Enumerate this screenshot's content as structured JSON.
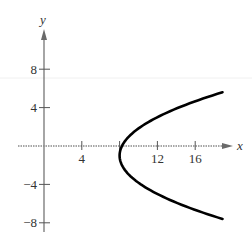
{
  "chart_data": {
    "type": "line",
    "title": "",
    "xlabel": "x",
    "ylabel": "y",
    "xlim": [
      0,
      19
    ],
    "ylim": [
      -9,
      11
    ],
    "x_ticks": [
      4,
      8,
      12,
      16
    ],
    "x_tick_labels": [
      "4",
      "",
      "12",
      "16"
    ],
    "y_ticks": [
      8,
      4,
      -4,
      -8
    ],
    "y_tick_labels": [
      "8",
      "4",
      "−4",
      "−8"
    ],
    "grid": false,
    "legend": null,
    "series": [
      {
        "name": "parabola",
        "equation": "(y+1)^2 = 4(x-8)",
        "vertex": [
          8,
          -1
        ],
        "y_range": [
          -7.6,
          5.6
        ],
        "points": [
          [
            18.9,
            5.6
          ],
          [
            17.0,
            5.0
          ],
          [
            14.25,
            4.0
          ],
          [
            12.0,
            3.0
          ],
          [
            10.25,
            2.0
          ],
          [
            9.0,
            1.0
          ],
          [
            8.25,
            0.0
          ],
          [
            8.0,
            -1.0
          ],
          [
            8.25,
            -2.0
          ],
          [
            9.0,
            -3.0
          ],
          [
            10.25,
            -4.0
          ],
          [
            12.0,
            -5.0
          ],
          [
            14.25,
            -6.0
          ],
          [
            17.0,
            -7.0
          ],
          [
            18.9,
            -7.6
          ]
        ]
      }
    ]
  },
  "labels": {
    "x_axis": "x",
    "y_axis": "y"
  }
}
